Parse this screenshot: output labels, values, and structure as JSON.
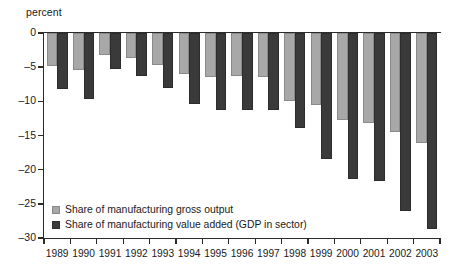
{
  "chart_data": {
    "type": "bar",
    "title": "",
    "subtitle": "",
    "xlabel": "",
    "ylabel": "percent",
    "ylim": [
      -30,
      0
    ],
    "ytick_labels": [
      "0",
      "–5",
      "–10",
      "–15",
      "–20",
      "–25",
      "–30"
    ],
    "ytick_values": [
      0,
      -5,
      -10,
      -15,
      -20,
      -25,
      -30
    ],
    "grid": false,
    "legend_position": "bottom-left-inside",
    "categories": [
      "1989",
      "1990",
      "1991",
      "1992",
      "1993",
      "1994",
      "1995",
      "1996",
      "1997",
      "1998",
      "1999",
      "2000",
      "2001",
      "2002",
      "2003"
    ],
    "series": [
      {
        "name": "Share of manufacturing gross output",
        "color": "#a8a8a8",
        "values": [
          -4.8,
          -5.4,
          -3.2,
          -3.7,
          -4.7,
          -6.0,
          -6.4,
          -6.3,
          -6.4,
          -9.9,
          -10.6,
          -12.7,
          -13.2,
          -14.5,
          -16.1
        ]
      },
      {
        "name": "Share of manufacturing value added (GDP in sector)",
        "color": "#3a3a3a",
        "values": [
          -8.2,
          -9.7,
          -5.3,
          -6.3,
          -8.1,
          -10.4,
          -11.2,
          -11.3,
          -11.3,
          -13.9,
          -18.5,
          -21.3,
          -21.6,
          -26.0,
          -28.7
        ]
      }
    ]
  },
  "axis": {
    "unit_label": "percent"
  },
  "legend": {
    "items": [
      {
        "label": "Share of manufacturing gross output",
        "swatch": "light-swatch-icon"
      },
      {
        "label": "Share of manufacturing value added (GDP in sector)",
        "swatch": "dark-swatch-icon"
      }
    ]
  }
}
